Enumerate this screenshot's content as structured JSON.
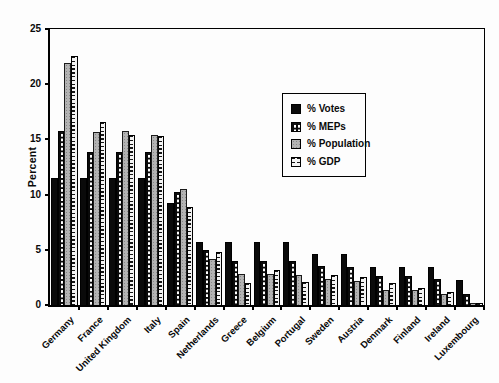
{
  "chart_data": {
    "type": "bar",
    "title": "",
    "xlabel": "",
    "ylabel": "Percent",
    "ylim": [
      0,
      25
    ],
    "yticks": [
      0,
      5,
      10,
      15,
      20,
      25
    ],
    "grid": false,
    "legend_position": "inside-upper-center-right",
    "categories": [
      "Germany",
      "France",
      "United Kingdom",
      "Italy",
      "Spain",
      "Netherlands",
      "Greece",
      "Belgium",
      "Portugal",
      "Sweden",
      "Austria",
      "Denmark",
      "Finland",
      "Ireland",
      "Luxembourg"
    ],
    "series": [
      {
        "name": "% Votes",
        "pattern": "solid-black",
        "values": [
          11.5,
          11.5,
          11.5,
          11.5,
          9.2,
          5.7,
          5.7,
          5.7,
          5.7,
          4.6,
          4.6,
          3.4,
          3.4,
          3.4,
          2.3
        ]
      },
      {
        "name": "% MEPs",
        "pattern": "white-dots-on-black",
        "values": [
          15.8,
          13.9,
          13.9,
          13.9,
          10.2,
          5.0,
          4.0,
          4.0,
          4.0,
          3.5,
          3.4,
          2.6,
          2.6,
          2.4,
          1.0
        ]
      },
      {
        "name": "% Population",
        "pattern": "speckled-gray",
        "values": [
          21.9,
          15.7,
          15.8,
          15.4,
          10.5,
          4.2,
          2.8,
          2.8,
          2.7,
          2.4,
          2.2,
          1.4,
          1.4,
          1.0,
          0.15
        ]
      },
      {
        "name": "% GDP",
        "pattern": "horizontal-dashes",
        "values": [
          22.6,
          16.6,
          15.4,
          15.3,
          8.9,
          4.8,
          2.0,
          3.2,
          2.1,
          2.7,
          2.5,
          2.0,
          1.5,
          1.2,
          0.2
        ]
      }
    ],
    "colors": {
      "bar_black": "#0a0a0a",
      "bar_gray": "#b3b3b3",
      "frame": "#000000",
      "background": "#fdfdfd"
    }
  }
}
